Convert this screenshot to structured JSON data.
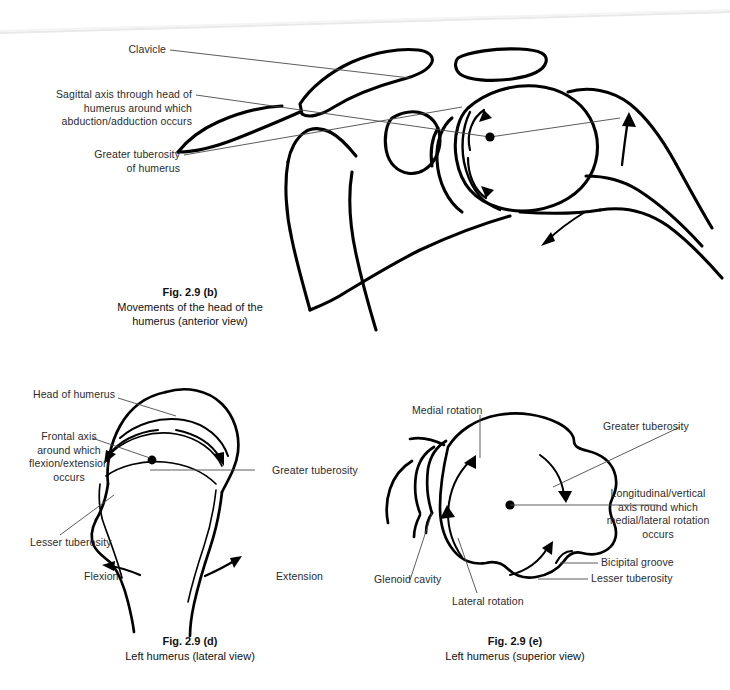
{
  "figure_set": {
    "id": "Fig. 2.9",
    "subject": "Movements of the head of the humerus"
  },
  "fig_b": {
    "view": "anterior",
    "caption_id": "Fig. 2.9 (b)",
    "caption_line1": "Movements of the head of the",
    "caption_line2": "humerus (anterior view)",
    "labels": {
      "clavicle": "Clavicle",
      "sagittal_axis_l1": "Sagittal axis through head of",
      "sagittal_axis_l2": "humerus around which",
      "sagittal_axis_l3": "abduction/adduction occurs",
      "greater_tuberosity_l1": "Greater tuberosity",
      "greater_tuberosity_l2": "of humerus"
    }
  },
  "fig_d": {
    "view": "lateral",
    "caption_id": "Fig. 2.9 (d)",
    "caption_line1": "Left humerus (lateral view)",
    "labels": {
      "head_of_humerus": "Head of humerus",
      "frontal_axis_l1": "Frontal axis",
      "frontal_axis_l2": "around which",
      "frontal_axis_l3": "flexion/extension",
      "frontal_axis_l4": "occurs",
      "greater_tuberosity": "Greater tuberosity",
      "lesser_tuberosity": "Lesser tuberosity",
      "flexion": "Flexion",
      "extension": "Extension"
    }
  },
  "fig_e": {
    "view": "superior",
    "caption_id": "Fig. 2.9 (e)",
    "caption_line1": "Left humerus (superior view)",
    "labels": {
      "medial_rotation": "Medial rotation",
      "lateral_rotation": "Lateral rotation",
      "greater_tuberosity": "Greater tuberosity",
      "longitudinal_axis_l1": "Longitudinal/vertical",
      "longitudinal_axis_l2": "axis round which",
      "longitudinal_axis_l3": "medial/lateral rotation",
      "longitudinal_axis_l4": "occurs",
      "bicipital_groove": "Bicipital groove",
      "lesser_tuberosity": "Lesser tuberosity",
      "glenoid_cavity": "Glenoid cavity"
    }
  },
  "colors": {
    "ink": "#000000",
    "text": "#2b2b2b",
    "leader": "#5a5a5a",
    "background": "#ffffff",
    "scan_artifact": "#ededed"
  }
}
